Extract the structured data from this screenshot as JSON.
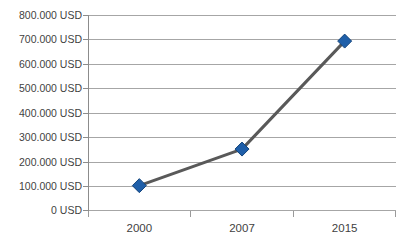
{
  "chart_data": {
    "type": "line",
    "title": "",
    "xlabel": "",
    "ylabel": "",
    "categories": [
      "2000",
      "2007",
      "2015"
    ],
    "x": [
      2000,
      2007,
      2015
    ],
    "values": [
      100000,
      250000,
      693000
    ],
    "series": [
      {
        "name": "USD",
        "values": [
          100000,
          250000,
          693000
        ]
      }
    ],
    "ylim": [
      0,
      800000
    ],
    "yticks": [
      0,
      100000,
      200000,
      300000,
      400000,
      500000,
      600000,
      700000,
      800000
    ],
    "ytick_labels": [
      "0 USD",
      "100.000 USD",
      "200.000 USD",
      "300.000 USD",
      "400.000 USD",
      "500.000 USD",
      "600.000 USD",
      "700.000 USD",
      "800.000 USD"
    ],
    "grid": true,
    "legend": false,
    "legend_position": "none",
    "marker": "diamond",
    "colors": {
      "line": "#595959",
      "marker_fill": "#1f5fa9",
      "marker_edge": "#14457c",
      "gridline": "#a6a6a6",
      "axis": "#8c8c8c",
      "text": "#3f3f3f",
      "background": "#ffffff"
    }
  },
  "axis": {
    "y_tick_labels_top_down": [
      "800.000 USD",
      "700.000 USD",
      "600.000 USD",
      "500.000 USD",
      "400.000 USD",
      "300.000 USD",
      "200.000 USD",
      "100.000 USD",
      "0 USD"
    ],
    "x_tick_labels": [
      "2000",
      "2007",
      "2015"
    ]
  }
}
